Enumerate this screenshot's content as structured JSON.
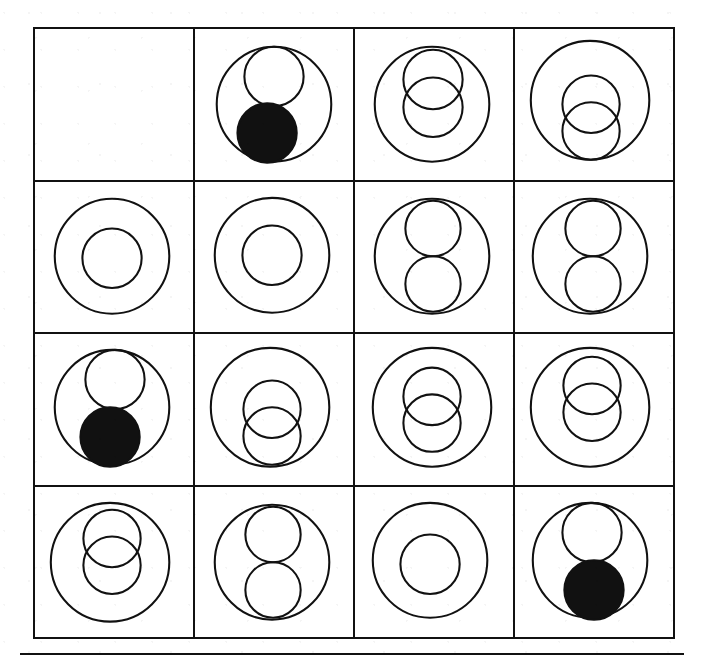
{
  "figure": {
    "kind": "visual-analogy-matrix",
    "title": "",
    "rows": 4,
    "columns": 4,
    "stroke_color": "#111111",
    "fill_color": "#111111",
    "background_color": "#ffffff",
    "has_bottom_rule": true
  },
  "chart_data": {
    "type": "table",
    "title": "",
    "xlabel": "",
    "ylabel": "",
    "grid": true,
    "legend": null,
    "rows": 4,
    "columns": 4,
    "cell_vocabulary": {
      "empty": "blank cell",
      "concentric": "one large outline circle with one smaller outline circle inside",
      "two-overlap": "one large outline circle containing two overlapping outline circles",
      "two-tangent": "one large outline circle containing two tangent stacked outline circles",
      "white-black": "one large outline circle containing one white outline circle above and one solid black circle below"
    },
    "categories": [
      "Column 1",
      "Column 2",
      "Column 3",
      "Column 4"
    ],
    "row_labels": [
      "Row 1",
      "Row 2",
      "Row 3",
      "Row 4"
    ],
    "cells": [
      {
        "id": "r1c1",
        "row": 1,
        "col": 1,
        "pattern": "empty",
        "label": "",
        "outer": null,
        "inner": [],
        "filled_count": 0
      },
      {
        "id": "r1c2",
        "row": 1,
        "col": 2,
        "pattern": "white-black",
        "label": "",
        "outer": {
          "cx": 80,
          "cy": 76,
          "r": 58
        },
        "inner": [
          {
            "cx": 80,
            "cy": 48,
            "r": 30,
            "fill": "none"
          },
          {
            "cx": 73,
            "cy": 105,
            "r": 30,
            "fill": "#111111"
          }
        ],
        "filled_count": 1
      },
      {
        "id": "r1c3",
        "row": 1,
        "col": 3,
        "pattern": "two-overlap",
        "label": "",
        "outer": {
          "cx": 78,
          "cy": 76,
          "r": 58
        },
        "inner": [
          {
            "cx": 79,
            "cy": 51,
            "r": 30,
            "fill": "none"
          },
          {
            "cx": 79,
            "cy": 79,
            "r": 30,
            "fill": "none"
          }
        ],
        "filled_count": 0
      },
      {
        "id": "r1c4",
        "row": 1,
        "col": 4,
        "pattern": "two-overlap",
        "label": "",
        "outer": {
          "cx": 76,
          "cy": 72,
          "r": 60
        },
        "inner": [
          {
            "cx": 77,
            "cy": 76,
            "r": 29,
            "fill": "none"
          },
          {
            "cx": 77,
            "cy": 103,
            "r": 29,
            "fill": "none"
          }
        ],
        "filled_count": 0
      },
      {
        "id": "r2c1",
        "row": 2,
        "col": 1,
        "pattern": "concentric",
        "label": "",
        "outer": {
          "cx": 78,
          "cy": 75,
          "r": 58
        },
        "inner": [
          {
            "cx": 78,
            "cy": 77,
            "r": 30,
            "fill": "none"
          }
        ],
        "filled_count": 0
      },
      {
        "id": "r2c2",
        "row": 2,
        "col": 2,
        "pattern": "concentric",
        "label": "",
        "outer": {
          "cx": 78,
          "cy": 74,
          "r": 58
        },
        "inner": [
          {
            "cx": 78,
            "cy": 74,
            "r": 30,
            "fill": "none"
          }
        ],
        "filled_count": 0
      },
      {
        "id": "r2c3",
        "row": 2,
        "col": 3,
        "pattern": "two-tangent",
        "label": "",
        "outer": {
          "cx": 78,
          "cy": 75,
          "r": 58
        },
        "inner": [
          {
            "cx": 79,
            "cy": 47,
            "r": 28,
            "fill": "none"
          },
          {
            "cx": 79,
            "cy": 103,
            "r": 28,
            "fill": "none"
          }
        ],
        "filled_count": 0
      },
      {
        "id": "r2c4",
        "row": 2,
        "col": 4,
        "pattern": "two-tangent",
        "label": "",
        "outer": {
          "cx": 76,
          "cy": 75,
          "r": 58
        },
        "inner": [
          {
            "cx": 79,
            "cy": 47,
            "r": 28,
            "fill": "none"
          },
          {
            "cx": 79,
            "cy": 103,
            "r": 28,
            "fill": "none"
          }
        ],
        "filled_count": 0
      },
      {
        "id": "r3c1",
        "row": 3,
        "col": 1,
        "pattern": "white-black",
        "label": "",
        "outer": {
          "cx": 78,
          "cy": 74,
          "r": 58
        },
        "inner": [
          {
            "cx": 81,
            "cy": 46,
            "r": 30,
            "fill": "none"
          },
          {
            "cx": 76,
            "cy": 104,
            "r": 30,
            "fill": "#111111"
          }
        ],
        "filled_count": 1
      },
      {
        "id": "r3c2",
        "row": 3,
        "col": 2,
        "pattern": "two-overlap",
        "label": "",
        "outer": {
          "cx": 76,
          "cy": 74,
          "r": 60
        },
        "inner": [
          {
            "cx": 78,
            "cy": 76,
            "r": 29,
            "fill": "none"
          },
          {
            "cx": 78,
            "cy": 103,
            "r": 29,
            "fill": "none"
          }
        ],
        "filled_count": 0
      },
      {
        "id": "r3c3",
        "row": 3,
        "col": 3,
        "pattern": "two-overlap",
        "label": "",
        "outer": {
          "cx": 78,
          "cy": 74,
          "r": 60
        },
        "inner": [
          {
            "cx": 78,
            "cy": 63,
            "r": 29,
            "fill": "none"
          },
          {
            "cx": 78,
            "cy": 90,
            "r": 29,
            "fill": "none"
          }
        ],
        "filled_count": 0
      },
      {
        "id": "r3c4",
        "row": 3,
        "col": 4,
        "pattern": "two-overlap",
        "label": "",
        "outer": {
          "cx": 76,
          "cy": 74,
          "r": 60
        },
        "inner": [
          {
            "cx": 78,
            "cy": 52,
            "r": 29,
            "fill": "none"
          },
          {
            "cx": 78,
            "cy": 79,
            "r": 29,
            "fill": "none"
          }
        ],
        "filled_count": 0
      },
      {
        "id": "r4c1",
        "row": 4,
        "col": 1,
        "pattern": "two-overlap",
        "label": "",
        "outer": {
          "cx": 76,
          "cy": 76,
          "r": 60
        },
        "inner": [
          {
            "cx": 78,
            "cy": 52,
            "r": 29,
            "fill": "none"
          },
          {
            "cx": 78,
            "cy": 79,
            "r": 29,
            "fill": "none"
          }
        ],
        "filled_count": 0
      },
      {
        "id": "r4c2",
        "row": 4,
        "col": 2,
        "pattern": "two-tangent",
        "label": "",
        "outer": {
          "cx": 78,
          "cy": 76,
          "r": 58
        },
        "inner": [
          {
            "cx": 79,
            "cy": 48,
            "r": 28,
            "fill": "none"
          },
          {
            "cx": 79,
            "cy": 104,
            "r": 28,
            "fill": "none"
          }
        ],
        "filled_count": 0
      },
      {
        "id": "r4c3",
        "row": 4,
        "col": 3,
        "pattern": "concentric",
        "label": "",
        "outer": {
          "cx": 76,
          "cy": 74,
          "r": 58
        },
        "inner": [
          {
            "cx": 76,
            "cy": 78,
            "r": 30,
            "fill": "none"
          }
        ],
        "filled_count": 0
      },
      {
        "id": "r4c4",
        "row": 4,
        "col": 4,
        "pattern": "white-black",
        "label": "",
        "outer": {
          "cx": 76,
          "cy": 74,
          "r": 58
        },
        "inner": [
          {
            "cx": 78,
            "cy": 46,
            "r": 30,
            "fill": "none"
          },
          {
            "cx": 80,
            "cy": 104,
            "r": 30,
            "fill": "#111111"
          }
        ],
        "filled_count": 1
      }
    ]
  }
}
